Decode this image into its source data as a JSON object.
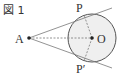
{
  "figure": {
    "caption": "図 1",
    "labels": {
      "A": "A",
      "O": "O",
      "P": "P",
      "P_prime": "P′"
    },
    "colors": {
      "circle_fill": "#efefef",
      "stroke": "#555555"
    }
  }
}
